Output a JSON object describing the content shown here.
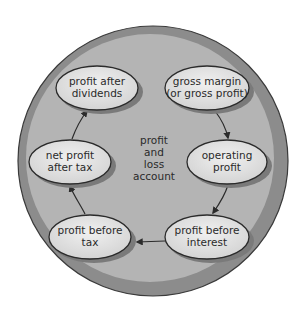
{
  "diagram": {
    "center_label": [
      "profit",
      "and",
      "loss",
      "account"
    ],
    "nodes": [
      {
        "id": "gross-margin",
        "lines": [
          "gross margin",
          "(or gross profit)"
        ],
        "cx": 207,
        "cy": 88
      },
      {
        "id": "operating-profit",
        "lines": [
          "operating",
          "profit"
        ],
        "cx": 227,
        "cy": 162
      },
      {
        "id": "profit-before-interest",
        "lines": [
          "profit before",
          "interest"
        ],
        "cx": 207,
        "cy": 237
      },
      {
        "id": "profit-before-tax",
        "lines": [
          "profit before",
          "tax"
        ],
        "cx": 90,
        "cy": 237
      },
      {
        "id": "net-profit-after-tax",
        "lines": [
          "net profit",
          "after tax"
        ],
        "cx": 70,
        "cy": 162
      },
      {
        "id": "profit-after-dividends",
        "lines": [
          "profit after",
          "dividends"
        ],
        "cx": 97,
        "cy": 88
      }
    ],
    "flow": [
      "gross margin (or gross profit)",
      "operating profit",
      "profit before interest",
      "profit before tax",
      "net profit after tax",
      "profit after dividends"
    ],
    "colors": {
      "rim": "#8c8c8c",
      "inner": "#b4b4b4",
      "node_fill": "#e2e2e2",
      "node_stroke": "#2b2b2b",
      "node_shadow": "#7a7a7a",
      "text": "#2a2a2a",
      "arrow": "#2b2b2b"
    }
  }
}
